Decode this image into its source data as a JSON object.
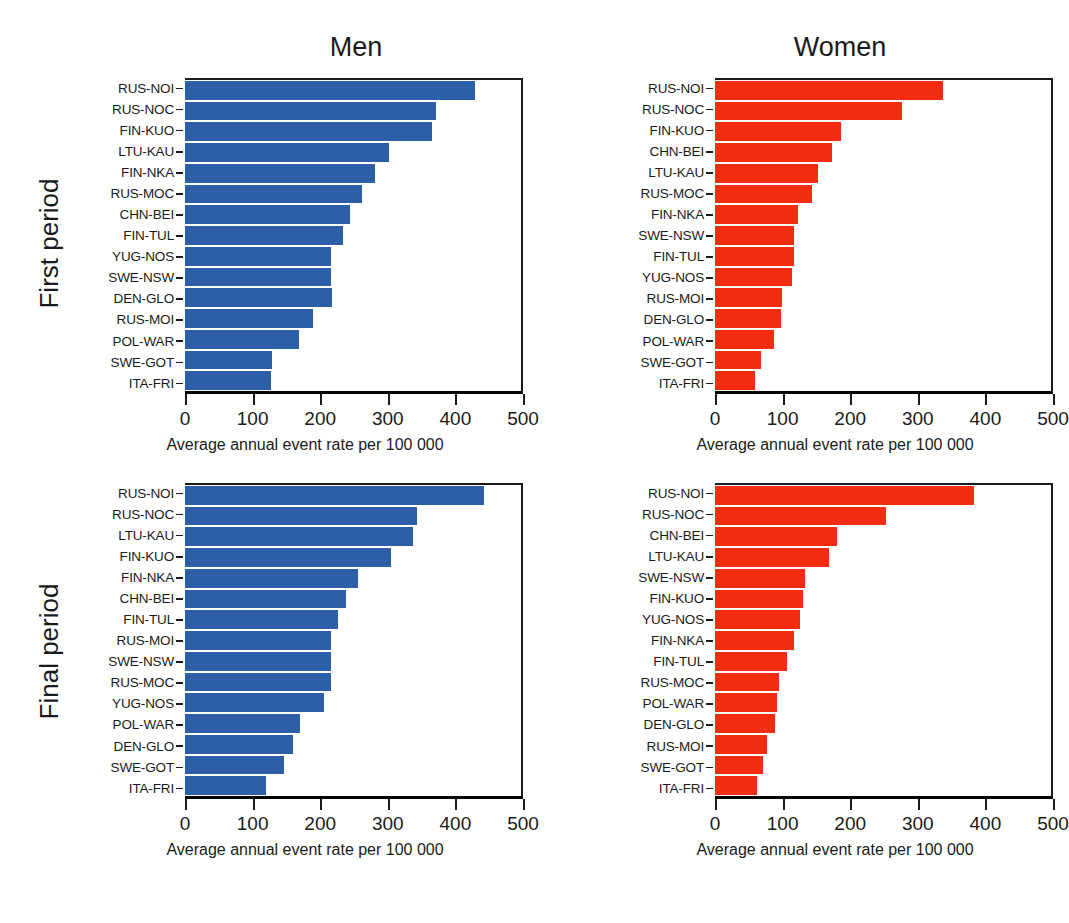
{
  "figure": {
    "top_fragment": "",
    "column_titles": [
      "Men",
      "Women"
    ],
    "row_titles": [
      "First period",
      "Final period"
    ],
    "axis_label": "Average annual event rate per 100 000",
    "tick_labels": [
      "0",
      "100",
      "200",
      "300",
      "400",
      "500"
    ],
    "colors": {
      "men": "#2d5ea8",
      "women": "#f42d10",
      "axis": "#1a1a1a"
    }
  },
  "chart_data": [
    {
      "type": "bar",
      "title": "Men",
      "subtitle": "First period",
      "orientation": "horizontal",
      "xlabel": "Average annual event rate per 100 000",
      "ylabel": "",
      "xlim": [
        0,
        500
      ],
      "xticks": [
        0,
        100,
        200,
        300,
        400,
        500
      ],
      "grid": false,
      "legend": "none",
      "color": "#2d5ea8",
      "categories": [
        "RUS-NOI",
        "RUS-NOC",
        "FIN-KUO",
        "LTU-KAU",
        "FIN-NKA",
        "RUS-MOC",
        "CHN-BEI",
        "FIN-TUL",
        "YUG-NOS",
        "SWE-NSW",
        "DEN-GLO",
        "RUS-MOI",
        "POL-WAR",
        "SWE-GOT",
        "ITA-FRI"
      ],
      "values": [
        431,
        374,
        367,
        303,
        283,
        263,
        246,
        235,
        218,
        218,
        219,
        190,
        169,
        129,
        128
      ]
    },
    {
      "type": "bar",
      "title": "Women",
      "subtitle": "First period",
      "orientation": "horizontal",
      "xlabel": "Average annual event rate per 100 000",
      "ylabel": "",
      "xlim": [
        0,
        500
      ],
      "xticks": [
        0,
        100,
        200,
        300,
        400,
        500
      ],
      "grid": false,
      "legend": "none",
      "color": "#f42d10",
      "categories": [
        "RUS-NOI",
        "RUS-NOC",
        "FIN-KUO",
        "CHN-BEI",
        "LTU-KAU",
        "RUS-MOC",
        "FIN-NKA",
        "SWE-NSW",
        "FIN-TUL",
        "YUG-NOS",
        "RUS-MOI",
        "DEN-GLO",
        "POL-WAR",
        "SWE-GOT",
        "ITA-FRI"
      ],
      "values": [
        340,
        279,
        187,
        174,
        154,
        144,
        123,
        118,
        118,
        115,
        99,
        98,
        88,
        68,
        60
      ]
    },
    {
      "type": "bar",
      "title": "Men",
      "subtitle": "Final period",
      "orientation": "horizontal",
      "xlabel": "Average annual event rate per 100 000",
      "ylabel": "",
      "xlim": [
        0,
        500
      ],
      "xticks": [
        0,
        100,
        200,
        300,
        400,
        500
      ],
      "grid": false,
      "legend": "none",
      "color": "#2d5ea8",
      "categories": [
        "RUS-NOI",
        "RUS-NOC",
        "LTU-KAU",
        "FIN-KUO",
        "FIN-NKA",
        "CHN-BEI",
        "FIN-TUL",
        "RUS-MOI",
        "SWE-NSW",
        "RUS-MOC",
        "YUG-NOS",
        "POL-WAR",
        "DEN-GLO",
        "SWE-GOT",
        "ITA-FRI"
      ],
      "values": [
        445,
        345,
        340,
        307,
        258,
        239,
        228,
        218,
        218,
        217,
        207,
        171,
        160,
        148,
        120
      ]
    },
    {
      "type": "bar",
      "title": "Women",
      "subtitle": "Final period",
      "orientation": "horizontal",
      "xlabel": "Average annual event rate per 100 000",
      "ylabel": "",
      "xlim": [
        0,
        500
      ],
      "xticks": [
        0,
        100,
        200,
        300,
        400,
        500
      ],
      "grid": false,
      "legend": "none",
      "color": "#f42d10",
      "categories": [
        "RUS-NOI",
        "RUS-NOC",
        "CHN-BEI",
        "LTU-KAU",
        "SWE-NSW",
        "FIN-KUO",
        "YUG-NOS",
        "FIN-NKA",
        "FIN-TUL",
        "RUS-MOC",
        "POL-WAR",
        "DEN-GLO",
        "RUS-MOI",
        "SWE-GOT",
        "ITA-FRI"
      ],
      "values": [
        386,
        255,
        181,
        170,
        134,
        131,
        126,
        117,
        107,
        95,
        93,
        90,
        78,
        72,
        63
      ]
    }
  ]
}
